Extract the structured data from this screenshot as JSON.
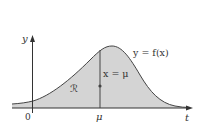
{
  "diagram": {
    "axes": {
      "x_label": "t",
      "y_label": "y",
      "origin_label": "0",
      "mu_tick_label": "μ"
    },
    "curve_label": "y = f(x)",
    "line_label": "x = μ",
    "region_label": "ℛ",
    "colors": {
      "fill": "#d4d4d4",
      "stroke": "#444444",
      "axis": "#333333",
      "text": "#333333"
    }
  }
}
